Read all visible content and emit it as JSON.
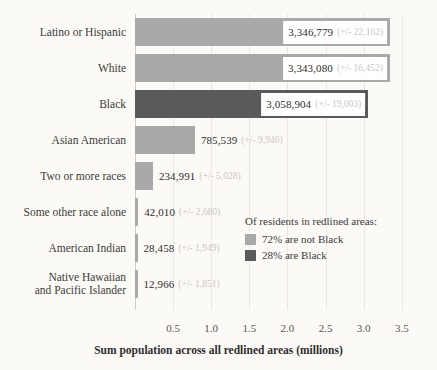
{
  "chart_data": {
    "type": "bar",
    "orientation": "horizontal",
    "title": "",
    "xlabel": "Sum population across all redlined areas (millions)",
    "ylabel": "",
    "xlim": [
      0,
      3.62
    ],
    "xticks": [
      0.5,
      1.0,
      1.5,
      2.0,
      2.5,
      3.0,
      3.5
    ],
    "xticklabels": [
      "0.5",
      "1.0",
      "1.5",
      "2.0",
      "2.5",
      "3.0",
      "3.5"
    ],
    "grid": "vertical",
    "units": "millions",
    "categories": [
      "Latino or Hispanic",
      "White",
      "Black",
      "Asian American",
      "Two or more races",
      "Some other race alone",
      "American Indian",
      "Native Hawaiian\nand Pacific Islander"
    ],
    "values": [
      3346779,
      3343080,
      3058904,
      785539,
      234991,
      42010,
      28458,
      12966
    ],
    "bars": [
      {
        "category": "Latino or Hispanic",
        "value": 3346779,
        "value_label": "3,346,779",
        "moe": 22162,
        "moe_label": "(+/- 22,162)",
        "color_key": "light",
        "label_position": "inside"
      },
      {
        "category": "White",
        "value": 3343080,
        "value_label": "3,343,080",
        "moe": 16452,
        "moe_label": "(+/- 16,452)",
        "color_key": "light",
        "label_position": "inside"
      },
      {
        "category": "Black",
        "value": 3058904,
        "value_label": "3,058,904",
        "moe": 19003,
        "moe_label": "(+/- 19,003)",
        "color_key": "dark",
        "label_position": "inside"
      },
      {
        "category": "Asian American",
        "value": 785539,
        "value_label": "785,539",
        "moe": 9946,
        "moe_label": "(+/- 9,946)",
        "color_key": "light",
        "label_position": "outside"
      },
      {
        "category": "Two or more races",
        "value": 234991,
        "value_label": "234,991",
        "moe": 5028,
        "moe_label": "(+/- 5,028)",
        "color_key": "light",
        "label_position": "outside"
      },
      {
        "category": "Some other race alone",
        "value": 42010,
        "value_label": "42,010",
        "moe": 2680,
        "moe_label": "(+/- 2,680)",
        "color_key": "light",
        "label_position": "outside"
      },
      {
        "category": "American Indian",
        "value": 28458,
        "value_label": "28,458",
        "moe": 1949,
        "moe_label": "(+/- 1,949)",
        "color_key": "light",
        "label_position": "outside"
      },
      {
        "category": "Native Hawaiian\nand Pacific Islander",
        "value": 12966,
        "value_label": "12,966",
        "moe": 1851,
        "moe_label": "(+/- 1,851)",
        "color_key": "light",
        "label_position": "outside"
      }
    ],
    "legend": {
      "position": "inside-bottom-right",
      "title": "Of residents in redlined areas:",
      "entries": [
        {
          "label": "72% are not Black",
          "color_key": "light",
          "percent": 72
        },
        {
          "label": "28% are Black",
          "color_key": "dark",
          "percent": 28
        }
      ]
    },
    "colors": {
      "light": "#a9a9a9",
      "dark": "#5a5a5a",
      "background": "#fbfaf7",
      "gridline": "#ebe8e3",
      "axis": "#cfcbc5",
      "text": "#3b3a38",
      "moe_text": "#cbc7c1",
      "label_box": "#ffffff"
    }
  }
}
